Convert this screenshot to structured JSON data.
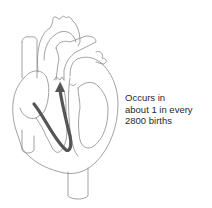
{
  "figure": {
    "annotation": {
      "lines": [
        "Occurs in",
        "about 1 in every",
        "2800 births"
      ]
    },
    "colors": {
      "outline": "#8a8a8a",
      "arrow": "#555555",
      "text": "#2a2a2a",
      "background": "#ffffff"
    }
  }
}
